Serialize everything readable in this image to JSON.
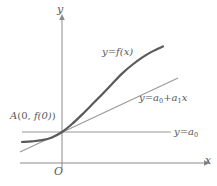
{
  "figure": {
    "background": "#ffffff"
  },
  "axes": {
    "y_label": "y",
    "x_label": "x",
    "origin_label": "O",
    "color": "#8a8a8c",
    "x_axis_y": 163,
    "y_axis_x": 62,
    "x_axis_from": 20,
    "x_axis_to": 206,
    "y_axis_from": 168,
    "y_axis_to": 18
  },
  "labels": {
    "curve": {
      "lhs": "y",
      "eq": "=",
      "rhs": "f(x)",
      "text": "y = f(x)"
    },
    "tangent": {
      "lhs": "y",
      "eq": "=",
      "term1": "a",
      "term1_sub": "0",
      "plus": "+",
      "term2": "a",
      "term2_sub": "1",
      "term2_var": "x",
      "text": "y = a0 + a1x"
    },
    "constant": {
      "lhs": "y",
      "eq": "=",
      "term": "a",
      "term_sub": "0",
      "text": "y = a0"
    },
    "point": {
      "name": "A",
      "open": "(",
      "x": "0",
      "comma": ",",
      "y": "f(0)",
      "close": ")",
      "text": "A(0, f(0))"
    }
  },
  "chart_data": {
    "type": "line",
    "xlabel": "x",
    "ylabel": "y",
    "grid": false,
    "legend": "inline-annotations",
    "origin_px": {
      "x": 62,
      "y": 163
    },
    "intersection_point_px": {
      "x": 62,
      "y": 132
    },
    "annotations": [
      {
        "name": "curve-label",
        "text": "y = f(x)",
        "px": {
          "x": 102,
          "y": 47
        }
      },
      {
        "name": "tangent-label",
        "text": "y = a0 + a1x",
        "px": {
          "x": 139,
          "y": 93
        }
      },
      {
        "name": "constant-label",
        "text": "y = a0",
        "px": {
          "x": 174,
          "y": 127
        }
      },
      {
        "name": "point-label",
        "text": "A(0, f(0))",
        "px": {
          "x": 10,
          "y": 111
        }
      }
    ],
    "series": [
      {
        "name": "y = f(x)",
        "role": "function-curve",
        "color": "#5a5a5c",
        "width": 2.2,
        "points_px": [
          [
            22,
            142
          ],
          [
            32,
            141.4
          ],
          [
            42,
            140.2
          ],
          [
            52,
            137.4
          ],
          [
            62,
            132
          ],
          [
            72,
            124
          ],
          [
            82,
            114.6
          ],
          [
            92,
            104.6
          ],
          [
            102,
            94.4
          ],
          [
            112,
            84
          ],
          [
            122,
            73.6
          ],
          [
            132,
            65
          ],
          [
            142,
            57.6
          ],
          [
            152,
            51.6
          ],
          [
            163,
            46.5
          ]
        ]
      },
      {
        "name": "y = a0 + a1x",
        "role": "tangent-line",
        "color": "#9a9a9c",
        "width": 1.2,
        "points_px": [
          [
            20,
            152
          ],
          [
            178,
            78
          ]
        ]
      },
      {
        "name": "y = a0",
        "role": "constant-line",
        "color": "#9a9a9c",
        "width": 1.2,
        "points_px": [
          [
            22,
            132
          ],
          [
            171,
            132
          ]
        ]
      }
    ]
  }
}
